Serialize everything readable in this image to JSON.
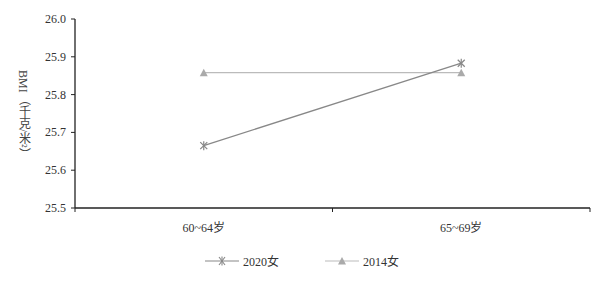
{
  "chart_data": {
    "type": "line",
    "title": "",
    "xlabel": "",
    "ylabel": "BMI（千克/米²）",
    "categories": [
      "60~64岁",
      "65~69岁"
    ],
    "series": [
      {
        "name": "2020女",
        "values": [
          25.665,
          25.883
        ],
        "color": "#888888",
        "marker": "asterisk"
      },
      {
        "name": "2014女",
        "values": [
          25.858,
          25.858
        ],
        "color": "#bbbbbb",
        "marker": "triangle"
      }
    ],
    "ylim": [
      25.5,
      26.0
    ],
    "yticks": [
      "25.5",
      "25.6",
      "25.7",
      "25.8",
      "25.9",
      "26.0"
    ],
    "grid": false,
    "legend_position": "bottom"
  },
  "axis": {
    "ylabel": "BMI（千克/米²）"
  },
  "legend": {
    "items": [
      {
        "label": "2020女"
      },
      {
        "label": "2014女"
      }
    ]
  }
}
